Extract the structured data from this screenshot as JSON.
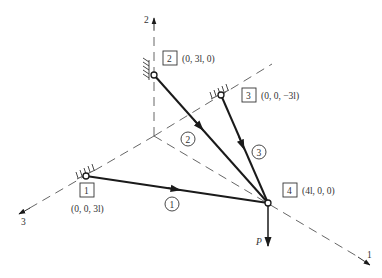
{
  "figure": {
    "axes": [
      {
        "id": "axis-1",
        "label": "1"
      },
      {
        "id": "axis-2",
        "label": "2"
      },
      {
        "id": "axis-3",
        "label": "3"
      }
    ],
    "nodes": [
      {
        "id": "1",
        "label": "1",
        "coords": "(0, 0, 3l)",
        "support": "fixed-pin"
      },
      {
        "id": "2",
        "label": "2",
        "coords": "(0, 3l, 0)",
        "support": "fixed-pin"
      },
      {
        "id": "3",
        "label": "3",
        "coords": "(0, 0, −3l)",
        "support": "fixed-pin"
      },
      {
        "id": "4",
        "label": "4",
        "coords": "(4l, 0, 0)",
        "support": "free"
      }
    ],
    "members": [
      {
        "id": "1",
        "label": "1",
        "from": "1",
        "to": "4"
      },
      {
        "id": "2",
        "label": "2",
        "from": "2",
        "to": "4"
      },
      {
        "id": "3",
        "label": "3",
        "from": "3",
        "to": "4"
      }
    ],
    "load": {
      "label": "P",
      "node": "4",
      "direction": "down"
    }
  }
}
